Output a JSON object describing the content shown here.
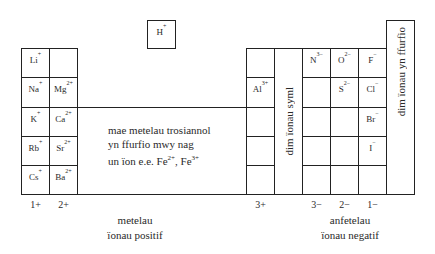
{
  "hydrogen": {
    "symbol": "H",
    "charge": "+"
  },
  "group1": [
    {
      "symbol": "Li",
      "charge": "+"
    },
    {
      "symbol": "Na",
      "charge": "+"
    },
    {
      "symbol": "K",
      "charge": "+"
    },
    {
      "symbol": "Rb",
      "charge": "+"
    },
    {
      "symbol": "Cs",
      "charge": "+"
    }
  ],
  "group2": [
    {
      "symbol": "",
      "charge": ""
    },
    {
      "symbol": "Mg",
      "charge": "2+"
    },
    {
      "symbol": "Ca",
      "charge": "2+"
    },
    {
      "symbol": "Sr",
      "charge": "2+"
    },
    {
      "symbol": "Ba",
      "charge": "2+"
    }
  ],
  "group3": [
    {
      "symbol": "",
      "charge": ""
    },
    {
      "symbol": "Al",
      "charge": "3+"
    },
    {
      "symbol": "",
      "charge": ""
    },
    {
      "symbol": "",
      "charge": ""
    },
    {
      "symbol": "",
      "charge": ""
    }
  ],
  "group5": [
    {
      "symbol": "N",
      "charge": "3−"
    },
    {
      "symbol": "",
      "charge": ""
    },
    {
      "symbol": "",
      "charge": ""
    },
    {
      "symbol": "",
      "charge": ""
    },
    {
      "symbol": "",
      "charge": ""
    }
  ],
  "group6": [
    {
      "symbol": "O",
      "charge": "2−"
    },
    {
      "symbol": "S",
      "charge": "2−"
    },
    {
      "symbol": "",
      "charge": ""
    },
    {
      "symbol": "",
      "charge": ""
    },
    {
      "symbol": "",
      "charge": ""
    }
  ],
  "group7": [
    {
      "symbol": "F",
      "charge": "−"
    },
    {
      "symbol": "Cl",
      "charge": "−"
    },
    {
      "symbol": "Br",
      "charge": "−"
    },
    {
      "symbol": "I",
      "charge": "−"
    },
    {
      "symbol": "",
      "charge": ""
    }
  ],
  "group4_label": "dim ïonau syml",
  "group0_label": "dim ïonau yn ffurfio",
  "transition": {
    "line1": "mae metelau trosiannol",
    "line2": "yn ffurfio mwy nag",
    "line3_prefix": "un ïon e.e. Fe",
    "fe2_charge": "2+",
    "separator": ", Fe",
    "fe3_charge": "3+"
  },
  "charges": {
    "g1": "1+",
    "g2": "2+",
    "g3": "3+",
    "g5": "3−",
    "g6": "2−",
    "g7": "1−"
  },
  "metals_label": {
    "line1": "metelau",
    "line2": "ïonau positif"
  },
  "nonmetals_label": {
    "line1": "anfetelau",
    "line2": "ïonau negatif"
  }
}
